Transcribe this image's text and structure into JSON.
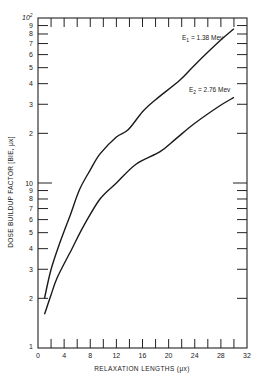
{
  "chart_data": {
    "type": "line",
    "title": "",
    "xlabel": "RELAXATION LENGTHS (μx)",
    "ylabel": "DOSE BUILDUP FACTOR [BIE, μx]",
    "xlim": [
      0,
      32
    ],
    "ylim": [
      1,
      100
    ],
    "yscale": "log",
    "grid": false,
    "x_ticks": [
      0,
      4,
      8,
      12,
      16,
      20,
      24,
      28,
      32
    ],
    "y_tick_labels": {
      "1": "1",
      "2": "2",
      "3": "3",
      "4": "4",
      "5": "5",
      "6": "6",
      "7": "7",
      "8": "8",
      "9": "9",
      "10": "10",
      "20": "2",
      "30": "3",
      "40": "4",
      "50": "5",
      "60": "6",
      "70": "7",
      "80": "8",
      "90": "9",
      "100": "10²"
    },
    "series": [
      {
        "name": "E₁ = 1.38 Mev",
        "x": [
          1,
          2,
          3.4,
          5,
          6.4,
          8,
          9.5,
          12,
          13.8,
          16,
          18,
          21.7,
          24,
          27.9,
          30
        ],
        "y": [
          2.0,
          3.0,
          4.4,
          6.5,
          9.2,
          12,
          15,
          19,
          21,
          27,
          32,
          42,
          52,
          73,
          86
        ]
      },
      {
        "name": "E₂ = 2.76 Mev",
        "x": [
          1,
          2,
          3,
          5.2,
          7,
          9.5,
          12,
          15,
          18.7,
          21.1,
          24,
          27.9,
          30
        ],
        "y": [
          1.6,
          2.1,
          2.7,
          4.0,
          5.5,
          8.0,
          10,
          13,
          15.5,
          18.5,
          23,
          29.5,
          33
        ]
      }
    ],
    "annotations": [
      {
        "text": "E₁ = 1.38 Mev",
        "near_x": 26,
        "near_y": 75
      },
      {
        "text": "E₂ = 2.76 Mev",
        "near_x": 26,
        "near_y": 30
      }
    ]
  },
  "labels": {
    "ylabel": "DOSE BUILDUP FACTOR [BIE, μx]",
    "xlabel": "RELAXATION LENGTHS (μx)",
    "e1_label_main": "E",
    "e1_sub": "1",
    "e1_value": " = 1.38 Mev",
    "e2_label_main": "E",
    "e2_sub": "2",
    "e2_value": " = 2.76 Mev",
    "top_label_main": "10",
    "top_label_exp": "2"
  }
}
